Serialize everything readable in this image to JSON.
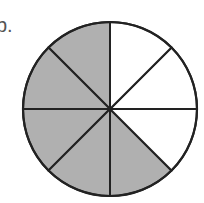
{
  "label": "b.",
  "diagram": {
    "type": "fraction-circle",
    "total_parts": 8,
    "shaded_parts": 5,
    "shaded_color": "#b0b0b0",
    "unshaded_color": "#ffffff",
    "stroke_color": "#222222",
    "shaded_indices": [
      0,
      1,
      2,
      3,
      4
    ]
  }
}
